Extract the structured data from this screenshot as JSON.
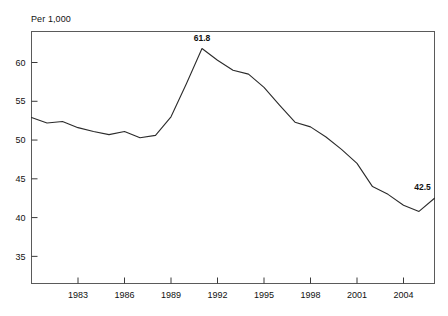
{
  "chart_data": {
    "type": "line",
    "title": "",
    "subtitle": "",
    "xlabel": "",
    "ylabel": "Per 1,000",
    "ylabel_position": "top-left",
    "grid": false,
    "legend": null,
    "xlim": [
      1980,
      2006
    ],
    "ylim": [
      31.5,
      64
    ],
    "y_ticks": [
      35,
      40,
      45,
      50,
      55,
      60
    ],
    "x_ticks": [
      1983,
      1986,
      1989,
      1992,
      1995,
      1998,
      2001,
      2004
    ],
    "x": [
      1980,
      1981,
      1982,
      1983,
      1984,
      1985,
      1986,
      1987,
      1988,
      1989,
      1990,
      1991,
      1992,
      1993,
      1994,
      1995,
      1996,
      1997,
      1998,
      1999,
      2000,
      2001,
      2002,
      2003,
      2004,
      2005,
      2006
    ],
    "values": [
      52.9,
      52.2,
      52.4,
      51.6,
      51.1,
      50.7,
      51.1,
      50.3,
      50.6,
      53.0,
      57.3,
      61.8,
      60.3,
      59.0,
      58.5,
      56.8,
      54.5,
      52.3,
      51.7,
      50.4,
      48.8,
      47.0,
      44.0,
      43.0,
      41.6,
      40.8,
      42.5
    ],
    "annotations": [
      {
        "label": "61.8",
        "x": 1991,
        "y": 61.8,
        "position": "above"
      },
      {
        "label": "42.5",
        "x": 2006,
        "y": 42.5,
        "position": "above-left"
      }
    ],
    "series": [
      {
        "name": "rate",
        "values": [
          52.9,
          52.2,
          52.4,
          51.6,
          51.1,
          50.7,
          51.1,
          50.3,
          50.6,
          53.0,
          57.3,
          61.8,
          60.3,
          59.0,
          58.5,
          56.8,
          54.5,
          52.3,
          51.7,
          50.4,
          48.8,
          47.0,
          44.0,
          43.0,
          41.6,
          40.8,
          42.5
        ],
        "color": "#2b2b2b"
      }
    ]
  },
  "colors": {
    "line": "#2b2b2b",
    "frame": "#5a5a5a",
    "text": "#111111",
    "background": "#ffffff"
  }
}
